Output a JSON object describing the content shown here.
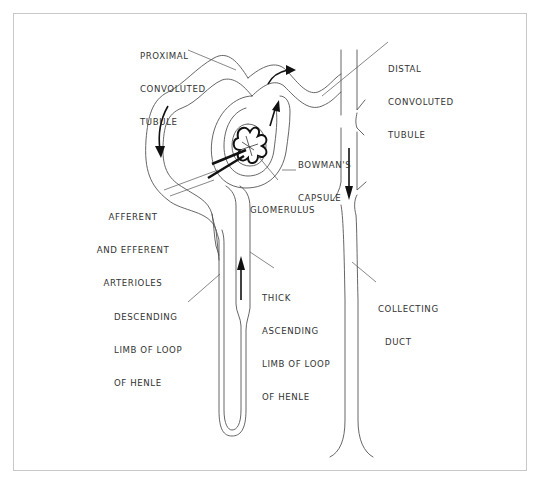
{
  "figure": {
    "type": "anatomical line diagram",
    "labels": {
      "proximal": [
        "PROXIMAL",
        "CONVOLUTED",
        "TUBULE"
      ],
      "distal": [
        "DISTAL",
        "CONVOLUTED",
        "TUBULE"
      ],
      "bowman": [
        "BOWMAN'S",
        "CAPSULE"
      ],
      "glomerulus": [
        "GLOMERULUS"
      ],
      "arterioles": [
        "AFFERENT",
        "AND EFFERENT",
        "ARTERIOLES"
      ],
      "thick_ascending": [
        "THICK",
        "ASCENDING",
        "LIMB OF LOOP",
        "OF HENLE"
      ],
      "descending": [
        "DESCENDING",
        "LIMB OF LOOP",
        "OF HENLE"
      ],
      "collecting": [
        "COLLECTING",
        "DUCT"
      ]
    },
    "flow_arrows": [
      {
        "location": "proximal tubule left side",
        "direction": "down"
      },
      {
        "location": "proximal tubule top",
        "direction": "right"
      },
      {
        "location": "inside Bowman's capsule",
        "direction": "up"
      },
      {
        "location": "thick ascending limb",
        "direction": "up"
      },
      {
        "location": "collecting duct",
        "direction": "down"
      }
    ],
    "colors": {
      "line": "#555555",
      "arrow": "#111111",
      "frame": "#c8c8c8",
      "background": "#ffffff"
    }
  }
}
